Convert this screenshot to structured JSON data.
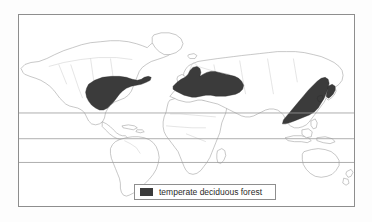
{
  "figure": {
    "type": "thematic-world-map",
    "background_color": "#fdfdfd",
    "frame_color": "#8e8e8e"
  },
  "map": {
    "projection_note": "world map, all continents",
    "coast_stroke_color": "#9a9a9a",
    "land_fill_color": "#ffffff",
    "latitude_lines": [
      {
        "name": "tropic-of-cancer",
        "y": 99
      },
      {
        "name": "equator",
        "y": 125
      },
      {
        "name": "tropic-of-capricorn",
        "y": 149
      }
    ],
    "highlight_color": "#3b3b3b",
    "highlighted_regions": [
      {
        "name": "eastern-north-america",
        "label": "temperate deciduous forest"
      },
      {
        "name": "europe",
        "label": "temperate deciduous forest"
      },
      {
        "name": "east-asia",
        "label": "temperate deciduous forest"
      }
    ]
  },
  "legend": {
    "swatch_color": "#3b3b3b",
    "label": "temperate deciduous forest",
    "border_color": "#8e8e8e"
  }
}
